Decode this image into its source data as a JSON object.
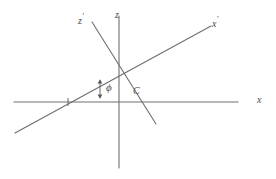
{
  "figure": {
    "background_color": "#ffffff",
    "line_color": "#6e6e6e",
    "text_color": "#4a4a4a"
  },
  "labels": {
    "z_prime": {
      "base": "z",
      "prime": "′",
      "x": 78,
      "y": 14
    },
    "z": {
      "base": "z",
      "prime": "",
      "x": 115,
      "y": 10
    },
    "x_prime": {
      "base": "x",
      "prime": "′",
      "x": 212,
      "y": 17
    },
    "x": {
      "base": "x",
      "prime": "",
      "x": 257,
      "y": 95
    },
    "phi": {
      "text": "ϕ",
      "x": 106,
      "y": 82
    },
    "c": {
      "text": "C",
      "x": 133,
      "y": 86
    }
  },
  "geometry": {
    "origin": {
      "x": 125,
      "y": 71
    },
    "x_axis": {
      "x1": 14,
      "y1": 102,
      "x2": 238,
      "y2": 102
    },
    "z_axis": {
      "x1": 119,
      "y1": 16,
      "x2": 119,
      "y2": 168
    },
    "x_prime_axis": {
      "x1": 15,
      "y1": 133,
      "x2": 211,
      "y2": 26
    },
    "z_prime_axis": {
      "x1": 92,
      "y1": 22,
      "x2": 156,
      "y2": 124
    },
    "tick_on_x_axis": {
      "x": 68,
      "y": 102
    },
    "angle_arrow": {
      "x": 100,
      "y_top": 80,
      "y_bottom": 98
    }
  },
  "meta": {
    "axis_names": [
      "x",
      "z",
      "x-prime",
      "z-prime"
    ],
    "angle_symbol_name": "phi",
    "point_name": "C"
  }
}
